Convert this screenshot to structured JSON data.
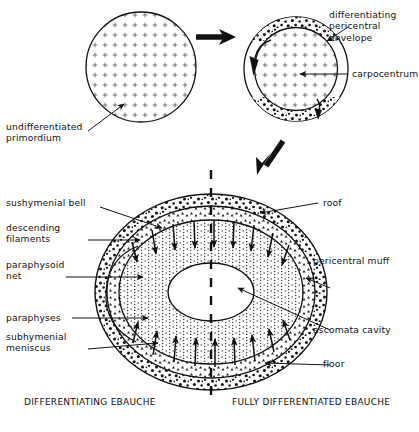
{
  "figure": {
    "stages": [
      {
        "id": "stage-1",
        "name": "undifferentiated primordium"
      },
      {
        "id": "stage-2",
        "name": "pericentral differentiation"
      },
      {
        "id": "stage-3",
        "name": "fully differentiated ebauche"
      }
    ]
  },
  "labels": {
    "undifferentiated_primordium": "undifferentiated\nprimordium",
    "differentiating_pericentral_envelope": "differentiating\npericentral\nenvelope",
    "carpocentrum": "carpocentrum",
    "sushymenial_bell": "sushymenial bell",
    "descending_filaments": "descending\nfilaments",
    "paraphysoid_net": "paraphysoid\nnet",
    "paraphyses": "paraphyses",
    "subhymenial_meniscus": "subhymenial\nmeniscus",
    "roof": "roof",
    "pericentral_muff": "pericentral muff",
    "ascomata_cavity": "ascomata cavity",
    "floor": "floor"
  },
  "captions": {
    "left": "DIFFERENTIATING EBAUCHE",
    "right": "FULLY DIFFERENTIATED EBAUCHE"
  },
  "colors": {
    "ink": "#111111",
    "background": "#ffffff",
    "stipple": "#1a1a1a"
  }
}
